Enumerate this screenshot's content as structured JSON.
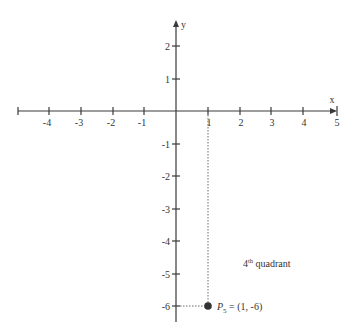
{
  "diagram": {
    "title": "",
    "x_axis": {
      "name": "x",
      "min_drawn": -5,
      "max_drawn": 5,
      "tick_labels": [
        "-4",
        "-3",
        "-2",
        "-1",
        "1",
        "2",
        "3",
        "4",
        "5"
      ],
      "tick_values": [
        -4,
        -3,
        -2,
        -1,
        1,
        2,
        3,
        4,
        5
      ]
    },
    "y_axis": {
      "name": "y",
      "min_drawn": -6.5,
      "max_drawn": 2.8,
      "tick_labels": [
        "2",
        "1",
        "-1",
        "-2",
        "-3",
        "-4",
        "-5",
        "-6"
      ],
      "tick_values": [
        2,
        1,
        -1,
        -2,
        -3,
        -4,
        -5,
        -6
      ]
    },
    "point": {
      "name": "P",
      "subscript": "5",
      "coords_text": " = (1, -6)",
      "x": 1,
      "y": -6,
      "color": "#333333"
    },
    "quadrant_label": {
      "number": "4",
      "superscript": "th",
      "text": " quadrant"
    },
    "colors": {
      "axis": "#3a3a3a",
      "guide": "#6a6a6a",
      "text": "#333333",
      "background": "#ffffff"
    }
  }
}
